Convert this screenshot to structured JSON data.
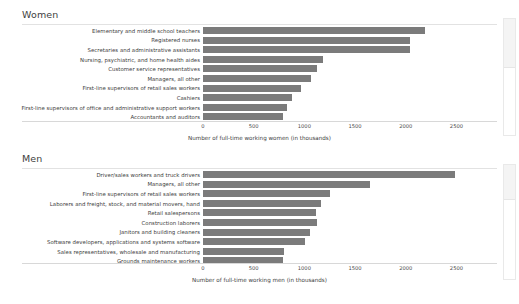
{
  "chart_data": [
    {
      "type": "bar",
      "orientation": "horizontal",
      "title": "Women",
      "categories": [
        "Elementary and middle school teachers",
        "Registered nurses",
        "Secretaries and administrative assistants",
        "Nursing, psychiatric, and home health aides",
        "Customer service representatives",
        "Managers, all other",
        "First-line supervisors of retail sales workers",
        "Cashiers",
        "First-line supervisors of office and administrative support workers",
        "Accountants and auditors"
      ],
      "values": [
        2190,
        2040,
        2040,
        1180,
        1120,
        1070,
        970,
        880,
        830,
        790
      ],
      "xlabel": "Number of full-time working women (in thousands)",
      "ylabel": "",
      "xticks": [
        0,
        500,
        1000,
        1500,
        2000,
        2500
      ],
      "xticklabels": [
        "0",
        "500",
        "1000",
        "1500",
        "2000",
        "2500"
      ],
      "xlim": [
        0,
        2900
      ],
      "grid": false,
      "legend": false,
      "bar_color": "#7b7b7b"
    },
    {
      "type": "bar",
      "orientation": "horizontal",
      "title": "Men",
      "categories": [
        "Driver/sales workers and truck drivers",
        "Managers, all other",
        "First-line supervisors of retail sales workers",
        "Laborers and freight, stock, and material movers, hand",
        "Retail salespersons",
        "Construction laborers",
        "Janitors and building cleaners",
        "Software developers, applications and systems software",
        "Sales representatives, wholesale and manufacturing",
        "Grounds maintenance workers"
      ],
      "values": [
        2490,
        1650,
        1250,
        1160,
        1110,
        1120,
        1060,
        1010,
        800,
        790
      ],
      "xlabel": "Number of full-time working men (in thousands)",
      "ylabel": "",
      "xticks": [
        0,
        500,
        1000,
        1500,
        2000,
        2500
      ],
      "xticklabels": [
        "0",
        "500",
        "1000",
        "1500",
        "2000",
        "2500"
      ],
      "xlim": [
        0,
        2900
      ],
      "grid": false,
      "legend": false,
      "bar_color": "#7b7b7b"
    }
  ],
  "panels": {
    "women": {
      "title": "Women",
      "axis_title": "Number of full-time working women (in thousands)"
    },
    "men": {
      "title": "Men",
      "axis_title": "Number of full-time working men (in thousands)"
    }
  },
  "colors": {
    "bar": "#7b7b7b",
    "axis": "#d8d8d8",
    "text": "#3c3c3c",
    "background": "#ffffff"
  }
}
